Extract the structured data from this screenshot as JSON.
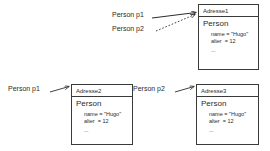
{
  "diagram": {
    "stroke_color": "#3a3a3a",
    "text_color": "#2b2b2b",
    "background": "#ffffff"
  },
  "objects": [
    {
      "id": "adresse1",
      "header": "Adresse1",
      "class_name": "Person",
      "attributes": [
        {
          "text": "name = \"Hugo\""
        },
        {
          "text": "alter  = 12"
        }
      ],
      "ellipsis": "..."
    },
    {
      "id": "adresse2",
      "header": "Adresse2",
      "class_name": "Person",
      "attributes": [
        {
          "text": "name = \"Hugo\""
        },
        {
          "text": "alter  = 12"
        }
      ],
      "ellipsis": "..."
    },
    {
      "id": "adresse3",
      "header": "Adresse3",
      "class_name": "Person",
      "attributes": [
        {
          "text": "name = \"Hugo\""
        },
        {
          "text": "alter  = 12"
        }
      ],
      "ellipsis": "..."
    }
  ],
  "references": [
    {
      "id": "ref-top-p1",
      "label": "Person p1",
      "style": "solid",
      "target": "adresse1"
    },
    {
      "id": "ref-top-p2",
      "label": "Person p2",
      "style": "dotted",
      "target": "adresse1"
    },
    {
      "id": "ref-left-p1",
      "label": "Person p1",
      "style": "solid",
      "target": "adresse2"
    },
    {
      "id": "ref-mid-p2",
      "label": "Person p2",
      "style": "solid",
      "target": "adresse3"
    }
  ]
}
